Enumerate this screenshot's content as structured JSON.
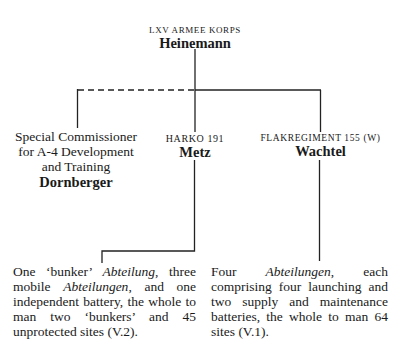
{
  "top": {
    "title": "LXV Armee Korps",
    "name": "Heinemann"
  },
  "left": {
    "title_lines": [
      "Special Commissioner",
      "for A-4 Development",
      "and Training"
    ],
    "name": "Dornberger",
    "connection": "dashed"
  },
  "middle": {
    "title": "Harko 191",
    "name": "Metz",
    "description_parts": [
      {
        "text": "One ‘bunker’ ",
        "italic": false
      },
      {
        "text": "Abteilung",
        "italic": true
      },
      {
        "text": ", three mobile ",
        "italic": false
      },
      {
        "text": "Abteilungen",
        "italic": true
      },
      {
        "text": ", and one independent battery, the whole to man two ‘bunkers’ and 45 unprotected sites (V.2).",
        "italic": false
      }
    ]
  },
  "right": {
    "title": "Flakregiment 155 (W)",
    "name": "Wachtel",
    "description_parts": [
      {
        "text": "Four ",
        "italic": false
      },
      {
        "text": "Abteilungen",
        "italic": true
      },
      {
        "text": ", each comprising four launching and two supply and maintenance batteries, the whole to man 64 sites (V.1).",
        "italic": false
      }
    ]
  },
  "colors": {
    "line": "#222222",
    "text": "#1a1a1a"
  }
}
